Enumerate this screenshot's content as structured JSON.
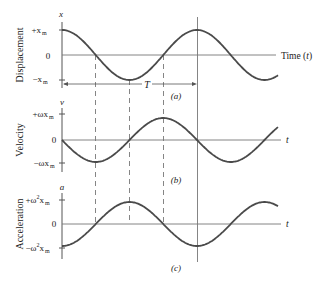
{
  "chart_data": [
    {
      "type": "line",
      "panel": "(a)",
      "ylabel": "Displacement",
      "axis_symbol": "x",
      "xlabel": "Time (t)",
      "yticks": [
        "+x_m",
        "0",
        "-x_m"
      ],
      "function": "x(t) = x_m cos(ωt)",
      "period_label": "T",
      "x": [
        0,
        0.25,
        0.5,
        0.75,
        1.0,
        1.25,
        1.5,
        1.6
      ],
      "x_units": "periods (T)",
      "values": [
        1,
        0,
        -1,
        0,
        1,
        0,
        -1,
        -0.81
      ]
    },
    {
      "type": "line",
      "panel": "(b)",
      "ylabel": "Velocity",
      "axis_symbol": "v",
      "xlabel": "t",
      "yticks": [
        "+ωx_m",
        "0",
        "-ωx_m"
      ],
      "function": "v(t) = -ωx_m sin(ωt)",
      "x": [
        0,
        0.25,
        0.5,
        0.75,
        1.0,
        1.25,
        1.5,
        1.6
      ],
      "x_units": "periods (T)",
      "values": [
        0,
        -1,
        0,
        1,
        0,
        -1,
        0,
        0.59
      ]
    },
    {
      "type": "line",
      "panel": "(c)",
      "ylabel": "Acceleration",
      "axis_symbol": "a",
      "xlabel": "t",
      "yticks": [
        "+ω²x_m",
        "0",
        "-ω²x_m"
      ],
      "function": "a(t) = -ω²x_m cos(ωt)",
      "x": [
        0,
        0.25,
        0.5,
        0.75,
        1.0,
        1.25,
        1.5,
        1.6
      ],
      "x_units": "periods (T)",
      "values": [
        -1,
        0,
        1,
        0,
        -1,
        0,
        1,
        0.81
      ]
    }
  ],
  "labels": {
    "disp": {
      "axis": "Displacement",
      "sym": "x",
      "plus": "+x",
      "minus": "−x",
      "sub": "m",
      "zero": "0",
      "xaxis": "Time (",
      "xaxis_t": "t",
      "xaxis_close": ")",
      "panel": "(a)",
      "period": "T"
    },
    "vel": {
      "axis": "Velocity",
      "sym": "v",
      "plus": "+ωx",
      "minus": "−ωx",
      "sub": "m",
      "zero": "0",
      "xaxis": "t",
      "panel": "(b)"
    },
    "acc": {
      "axis": "Acceleration",
      "sym": "a",
      "plus": "+ω",
      "minus": "−ω",
      "sup": "2",
      "x": "x",
      "sub": "m",
      "zero": "0",
      "xaxis": "t",
      "panel": "(c)"
    }
  },
  "style": {
    "curve": "#4a4a4a",
    "axis": "#555555",
    "text": "#222222"
  }
}
